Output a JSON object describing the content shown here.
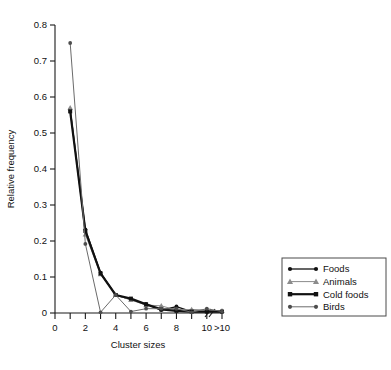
{
  "chart_data": {
    "type": "line",
    "title": "",
    "xlabel": "Cluster sizes",
    "ylabel": "Relative frequency",
    "xlim": [
      0,
      11
    ],
    "ylim": [
      0,
      0.8
    ],
    "grid": false,
    "axis_break": {
      "present": true,
      "between": [
        "10",
        ">10"
      ],
      "symbol": "//"
    },
    "x_tick_labels": [
      "0",
      "2",
      "4",
      "6",
      "8",
      "10",
      ">10"
    ],
    "x_tick_values": [
      0,
      2,
      4,
      6,
      8,
      10,
      11
    ],
    "x_minor_tick_values": [
      1,
      3,
      5,
      7,
      9
    ],
    "y_tick_labels": [
      "0",
      "0.1",
      "0.2",
      "0.3",
      "0.4",
      "0.5",
      "0.6",
      "0.7",
      "0.8"
    ],
    "y_tick_values": [
      0,
      0.1,
      0.2,
      0.3,
      0.4,
      0.5,
      0.6,
      0.7,
      0.8
    ],
    "x": [
      1,
      2,
      3,
      4,
      5,
      6,
      7,
      8,
      9,
      10,
      11
    ],
    "legend_position": "right",
    "series": [
      {
        "name": "Foods",
        "marker": "circle",
        "color": "#111111",
        "line_color": "#111111",
        "line_width": 1.3,
        "values": [
          0.565,
          0.232,
          0.112,
          0.05,
          0.038,
          0.025,
          0.008,
          0.018,
          0.004,
          0.004,
          0.004
        ]
      },
      {
        "name": "Animals",
        "marker": "triangle",
        "color": "#8c8c8c",
        "line_color": "#8c8c8c",
        "line_width": 1.0,
        "values": [
          0.57,
          0.218,
          0.108,
          0.05,
          0.036,
          0.022,
          0.02,
          0.008,
          0.01,
          0.008,
          0.006
        ]
      },
      {
        "name": "Cold foods",
        "marker": "square",
        "color": "#111111",
        "line_color": "#111111",
        "line_width": 2.2,
        "values": [
          0.56,
          0.228,
          0.11,
          0.05,
          0.04,
          0.024,
          0.01,
          0.006,
          0.004,
          0.004,
          0.004
        ]
      },
      {
        "name": "Birds",
        "marker": "circle",
        "color": "#4d4d4d",
        "line_color": "#6b6b6b",
        "line_width": 1.0,
        "values": [
          0.75,
          0.192,
          0.002,
          0.05,
          0.004,
          0.012,
          0.012,
          0.012,
          0.002,
          0.012,
          0.004
        ]
      }
    ]
  },
  "legend": {
    "entries": [
      {
        "label": "Foods"
      },
      {
        "label": "Animals"
      },
      {
        "label": "Cold foods"
      },
      {
        "label": "Birds"
      }
    ]
  }
}
